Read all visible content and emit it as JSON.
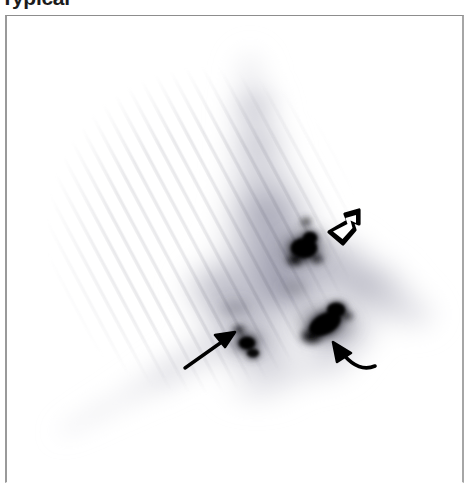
{
  "caption": {
    "text": "Typical",
    "clipped": true
  },
  "figure": {
    "label": "scintigraphy-scan",
    "modality": "planar nuclear medicine scintigram",
    "orientation": "anterior",
    "colormap": "inverted grayscale (hot = dark)",
    "background_color": "#ffffff",
    "frame_color": "#9a9a9a",
    "hotspot_color": "#000000",
    "tissue_color": "#b9b9c4",
    "arrow_color": "#000000"
  },
  "scan_content": {
    "body_outline_description": "broad inverted-Y shaped tracer distribution with apex at upper center and two lower limbs",
    "hotspots": [
      {
        "name": "upper-central-focus",
        "cx": 297,
        "cy": 232,
        "rx": 20,
        "ry": 17,
        "intensity": "intense"
      },
      {
        "name": "lower-right-focus",
        "cx": 318,
        "cy": 308,
        "rx": 24,
        "ry": 18,
        "intensity": "intense"
      },
      {
        "name": "lower-left-focus",
        "cx": 238,
        "cy": 325,
        "rx": 14,
        "ry": 11,
        "intensity": "moderate"
      }
    ]
  },
  "annotations": [
    {
      "name": "hollow-arrow-upper-right",
      "style": "outlined-open-arrowhead",
      "direction": "down-left",
      "tip_x": 323,
      "tip_y": 216,
      "points_to": "upper-central-focus"
    },
    {
      "name": "straight-arrow-lower-left",
      "style": "solid-line-arrow",
      "direction": "up-right",
      "tip_x": 228,
      "tip_y": 317,
      "points_to": "lower-left-focus"
    },
    {
      "name": "curved-arrow-lower-right",
      "style": "solid-curved-arrow",
      "direction": "up-left",
      "tip_x": 327,
      "tip_y": 327,
      "points_to": "lower-right-focus"
    }
  ]
}
